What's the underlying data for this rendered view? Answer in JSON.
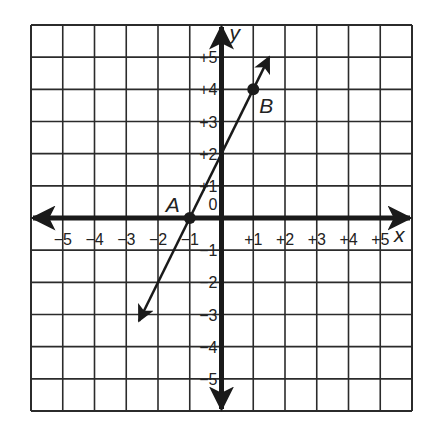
{
  "chart_data": {
    "type": "line",
    "title": "",
    "xlabel": "x",
    "ylabel": "y",
    "xlim": [
      -6,
      6
    ],
    "ylim": [
      -6,
      6
    ],
    "grid": true,
    "x_ticks": [
      "-5",
      "-4",
      "-3",
      "-2",
      "-1",
      "+1",
      "+2",
      "+3",
      "+4",
      "+5"
    ],
    "y_ticks": [
      "+5",
      "+4",
      "+3",
      "+2",
      "+1",
      "0",
      "-1",
      "-2",
      "-3",
      "-4",
      "-5"
    ],
    "origin_label": "0",
    "line": {
      "equation": "y = 2x + 2",
      "slope": 2,
      "intercept": 2,
      "x_start": -2.6,
      "x_end": 1.5,
      "arrows": "both"
    },
    "points": [
      {
        "label": "A",
        "x": -1,
        "y": 0
      },
      {
        "label": "B",
        "x": 1,
        "y": 4
      }
    ]
  },
  "colors": {
    "ink": "#1a1a1a",
    "grid": "#2b2b2b",
    "background": "#ffffff"
  }
}
